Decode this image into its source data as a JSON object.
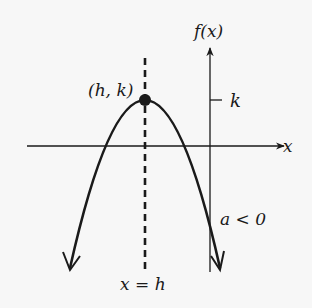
{
  "diagram": {
    "type": "parabola-graph",
    "labels": {
      "vertex": "(h, k)",
      "y_axis": "f(x)",
      "x_axis": "x",
      "k_tick": "k",
      "leading_coefficient": "a < 0",
      "axis_of_symmetry": "x = h"
    },
    "colors": {
      "background": "#f7f7f7",
      "ink": "#1a1a1a"
    }
  }
}
